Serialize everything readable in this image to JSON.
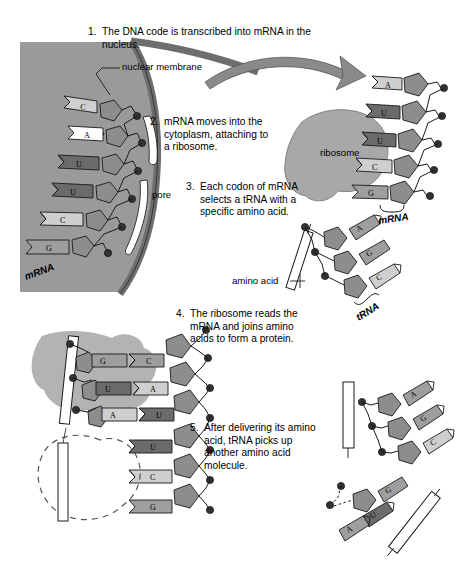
{
  "diagram": {
    "colors": {
      "nucleus_fill": "#9a9a9a",
      "membrane_fill": "#6e6e6e",
      "ribosome_fill": "#a8a8a8",
      "base_dark": "#6b6b6b",
      "base_mid": "#9e9e9e",
      "base_light": "#cfcfcf",
      "sugar_fill": "#8d8d8d",
      "phosphate_fill": "#3a3a3a",
      "arrow_fill": "#8a8a8a",
      "outline": "#1a1a1a",
      "background": "#ffffff"
    },
    "steps": [
      {
        "number": "1.",
        "text": "The DNA code is transcribed into mRNA in the nucleus."
      },
      {
        "number": "2.",
        "text": "mRNA moves into the cytoplasm, attaching to a ribosome."
      },
      {
        "number": "3.",
        "text": "Each codon of mRNA selects a tRNA with a specific amino acid."
      },
      {
        "number": "4.",
        "text": "The ribosome reads the mRNA and joins amino acids to form a protein."
      },
      {
        "number": "5.",
        "text": "After delivering its amino acid, tRNA picks up another amino acid molecule."
      }
    ],
    "labels": {
      "nuclear_membrane": "nuclear membrane",
      "pore": "pore",
      "ribosome": "ribosome",
      "amino_acid": "amino acid",
      "mrna_nucleus": "mRNA",
      "mrna_ribosome": "mRNA",
      "trna": "tRNA"
    },
    "sequences": {
      "nucleus_mrna_bases": [
        "C",
        "A",
        "U",
        "U",
        "C",
        "G"
      ],
      "cytoplasm_mrna_bases": [
        "C",
        "A",
        "U",
        "U",
        "C",
        "G"
      ],
      "ribosome_codon_bases": [
        "U",
        "C",
        "G"
      ],
      "trna_anticodon_bases": [
        "A",
        "G",
        "C"
      ],
      "step4_mrna_bases": [
        "C",
        "A",
        "U",
        "U",
        "C",
        "G"
      ],
      "step4_trna_bases": [
        "G",
        "U",
        "A"
      ],
      "step5_trna_bases": [
        "A",
        "G",
        "C"
      ],
      "step5_free_trna_bases": [
        "G",
        "U",
        "A"
      ]
    }
  }
}
